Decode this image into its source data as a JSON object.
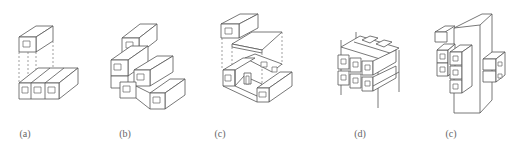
{
  "figure": {
    "panels": [
      {
        "id": "a",
        "caption": "(a)",
        "description": "Single module lifted above a three-module base row, connected by dashed guide lines"
      },
      {
        "id": "b",
        "caption": "(b)",
        "description": "Stepped stack of modules arranged in terraced configuration"
      },
      {
        "id": "c",
        "caption": "(c)",
        "description": "Modules and floor plate separated with dashed guides, forming courtyard with doorway"
      },
      {
        "id": "d",
        "caption": "(d)",
        "description": "Modules plugged into a vertical frame structure, 3x2 grid"
      },
      {
        "id": "e",
        "caption": "(c)",
        "description": "Modules attached to a central tall core in cantilever clusters"
      }
    ]
  }
}
